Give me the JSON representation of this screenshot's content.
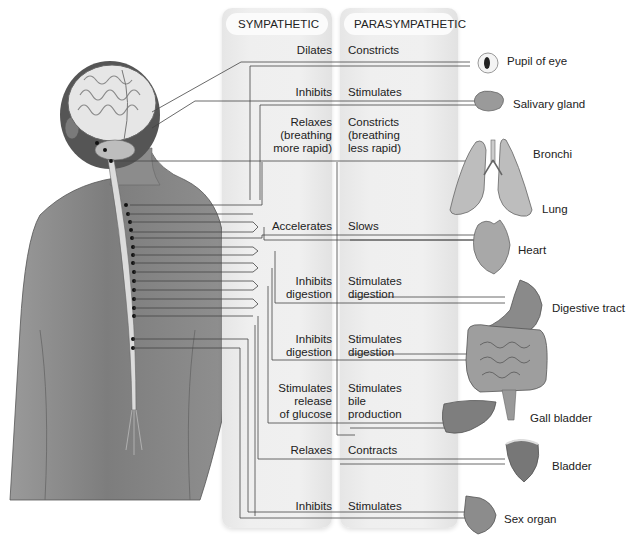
{
  "headers": {
    "sympathetic": "SYMPATHETIC",
    "parasympathetic": "PARASYMPATHETIC"
  },
  "rows": [
    {
      "organ": "Pupil of eye",
      "sympathetic": "Dilates",
      "parasympathetic": "Constricts"
    },
    {
      "organ": "Salivary gland",
      "sympathetic": "Inhibits",
      "parasympathetic": "Stimulates"
    },
    {
      "organ": "Bronchi",
      "sympathetic": "Relaxes\n(breathing\nmore rapid)",
      "parasympathetic": "Constricts\n(breathing\nless rapid)"
    },
    {
      "organ": "Heart",
      "sympathetic": "Accelerates",
      "parasympathetic": "Slows"
    },
    {
      "organ": "Digestive tract",
      "sympathetic": "Inhibits\ndigestion",
      "parasympathetic": "Stimulates\ndigestion"
    },
    {
      "organ": "Digestive tract (intestines)",
      "sympathetic": "Inhibits\ndigestion",
      "parasympathetic": "Stimulates\ndigestion"
    },
    {
      "organ": "Gall bladder",
      "sympathetic": "Stimulates\nrelease\nof glucose",
      "parasympathetic": "Stimulates\nbile\nproduction"
    },
    {
      "organ": "Bladder",
      "sympathetic": "Relaxes",
      "parasympathetic": "Contracts"
    },
    {
      "organ": "Sex organ",
      "sympathetic": "Inhibits",
      "parasympathetic": "Stimulates"
    }
  ],
  "organ_labels": {
    "pupil": "Pupil of eye",
    "salivary": "Salivary gland",
    "bronchi": "Bronchi",
    "lung": "Lung",
    "heart": "Heart",
    "digestive": "Digestive tract",
    "gallbladder": "Gall bladder",
    "bladder": "Bladder",
    "sex": "Sex organ"
  },
  "colors": {
    "line": "#444444",
    "panel": "#ececec",
    "skin": "#8a8a8a"
  }
}
